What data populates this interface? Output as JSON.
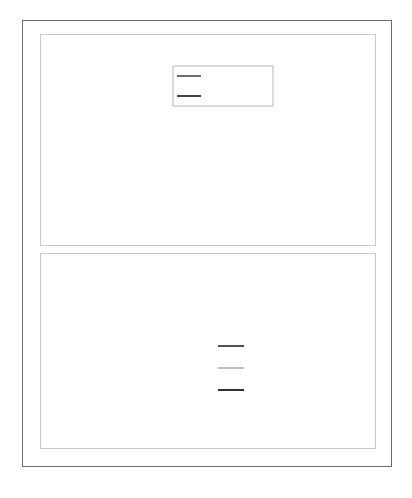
{
  "chart_data": [
    {
      "type": "line",
      "title": "",
      "xlabel": "",
      "ylabel": "",
      "xlim": [
        0,
        5
      ],
      "ylim": [
        0,
        1.5
      ],
      "xticks": [
        "0",
        "1",
        "2",
        "3",
        "4",
        "5"
      ],
      "yticks": [
        "0.0",
        "0.5",
        "1.0",
        "1.5"
      ],
      "grid": false,
      "legend_position": "upper-center",
      "x": [
        0,
        0.1,
        0.2,
        0.3,
        0.37,
        0.5,
        0.75,
        1.0,
        1.25,
        1.5,
        2.0,
        2.5,
        3.0,
        3.5,
        4.0,
        5.0
      ],
      "series": [
        {
          "name": "r|1+1'⟩",
          "color": "#606060",
          "values": [
            0,
            0.73,
            1.08,
            1.2,
            1.21,
            1.15,
            0.92,
            0.66,
            0.45,
            0.29,
            0.11,
            0.04,
            0.014,
            0.005,
            0.002,
            0.0
          ]
        },
        {
          "name": "rR(r:Li_1s)",
          "color": "#303030",
          "values": [
            0,
            0.73,
            1.08,
            1.2,
            1.21,
            1.15,
            0.92,
            0.66,
            0.45,
            0.29,
            0.11,
            0.04,
            0.014,
            0.005,
            0.002,
            0.0
          ]
        }
      ]
    },
    {
      "type": "line",
      "title": "",
      "xlabel": "r [a.u.]",
      "ylabel": "",
      "xlim": [
        0,
        5
      ],
      "ylim": [
        0,
        0.3
      ],
      "xticks": [
        "0",
        "1",
        "2",
        "3",
        "4",
        "5"
      ],
      "yticks": [
        "0.0",
        "0.1",
        "0.2",
        "0.3"
      ],
      "grid": false,
      "legend_position": "center-right",
      "x": [
        0,
        0.25,
        0.5,
        0.8,
        1.0,
        1.5,
        2.0,
        2.5,
        3.0,
        3.5,
        4.0,
        4.5,
        5.0
      ],
      "series": [
        {
          "name": "RDF-Li_2s",
          "color": "#404040",
          "values": [
            0,
            0.037,
            0.02,
            0.0,
            0.012,
            0.09,
            0.19,
            0.25,
            0.27,
            0.255,
            0.225,
            0.185,
            0.14
          ]
        },
        {
          "name": "RDF-DZ",
          "color": "#a8a8a8",
          "values": [
            0,
            0.001,
            0.01,
            0.03,
            0.05,
            0.125,
            0.2,
            0.245,
            0.262,
            0.25,
            0.22,
            0.182,
            0.14
          ]
        },
        {
          "name": "RDF-|2s-1s⟩",
          "color": "#1e1e1e",
          "values": [
            0,
            0.037,
            0.02,
            0.0,
            0.01,
            0.087,
            0.19,
            0.252,
            0.276,
            0.262,
            0.228,
            0.187,
            0.142
          ]
        }
      ]
    }
  ],
  "caption": "Figure 1.12  Radial functions and radial distribution functions of lithium"
}
